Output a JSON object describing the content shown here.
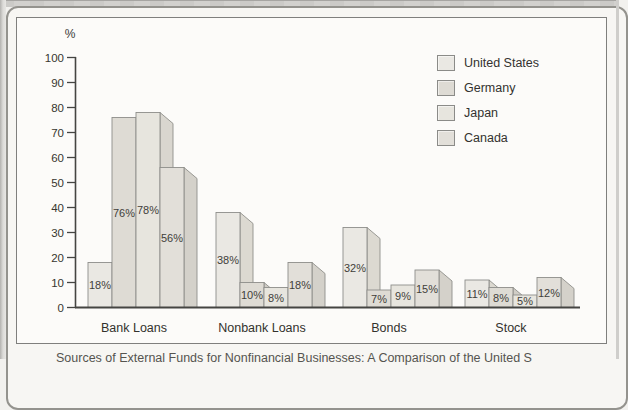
{
  "page": {
    "caption_partial": "Sources of External Funds for Nonfinancial Businesses: A Comparison of the United S"
  },
  "chart_data": {
    "type": "bar",
    "title": "",
    "xlabel": "",
    "ylabel": "%",
    "categories": [
      "Bank Loans",
      "Nonbank Loans",
      "Bonds",
      "Stock"
    ],
    "series": [
      {
        "name": "United States",
        "values": [
          18,
          38,
          32,
          11
        ],
        "front": "#eae8e3",
        "side": "#dcd9d1"
      },
      {
        "name": "Germany",
        "values": [
          76,
          10,
          7,
          8
        ],
        "front": "#dedbd4",
        "side": "#d0cdc6"
      },
      {
        "name": "Japan",
        "values": [
          78,
          8,
          9,
          5
        ],
        "front": "#e7e5de",
        "side": "#d9d6cf"
      },
      {
        "name": "Canada",
        "values": [
          56,
          18,
          15,
          12
        ],
        "front": "#e2dfd9",
        "side": "#d4d1ca"
      }
    ],
    "bar_labels": [
      [
        "18%",
        "76%",
        "78%",
        "56%"
      ],
      [
        "38%",
        "10%",
        "8%",
        "18%"
      ],
      [
        "32%",
        "7%",
        "9%",
        "15%"
      ],
      [
        "11%",
        "8%",
        "5%",
        "12%"
      ]
    ],
    "ylim": [
      0,
      100
    ],
    "ytick_step": 10,
    "yticks": [
      0,
      10,
      20,
      30,
      40,
      50,
      60,
      70,
      80,
      90,
      100
    ],
    "grid": false,
    "legend_position": "top-right",
    "style": "pseudo-3d bars, monochrome scanned textbook figure",
    "axis_color": "#454542",
    "bar_stroke": "#8e8e8a",
    "label_color": "#3f3e3a"
  }
}
